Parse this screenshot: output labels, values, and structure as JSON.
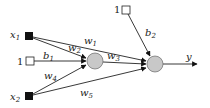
{
  "diagram": {
    "type": "neural-network",
    "inputs": [
      {
        "id": "x1",
        "label": "x",
        "sub": "1",
        "kind": "input"
      },
      {
        "id": "bias1",
        "label": "1",
        "kind": "bias"
      },
      {
        "id": "x2",
        "label": "x",
        "sub": "2",
        "kind": "input"
      },
      {
        "id": "bias2",
        "label": "1",
        "kind": "bias"
      }
    ],
    "neurons": [
      {
        "id": "hidden",
        "fill": "#c8c8c8"
      },
      {
        "id": "output",
        "fill": "#c8c8c8"
      }
    ],
    "edges": [
      {
        "from": "x1",
        "to": "output",
        "label": "w",
        "sub": "1"
      },
      {
        "from": "x1",
        "to": "hidden",
        "label": "w",
        "sub": "2"
      },
      {
        "from": "bias1",
        "to": "hidden",
        "label": "b",
        "sub": "1"
      },
      {
        "from": "hidden",
        "to": "output",
        "label": "w",
        "sub": "3"
      },
      {
        "from": "x2",
        "to": "hidden",
        "label": "w",
        "sub": "4"
      },
      {
        "from": "x2",
        "to": "output",
        "label": "w",
        "sub": "5"
      },
      {
        "from": "bias2",
        "to": "output",
        "label": "b",
        "sub": "2"
      },
      {
        "from": "output",
        "to": "y",
        "label": "y"
      }
    ],
    "output_label": "y"
  }
}
